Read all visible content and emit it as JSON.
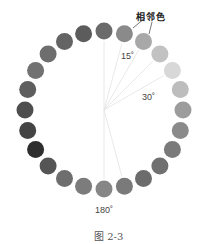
{
  "diagram": {
    "type": "color-wheel-grayscale",
    "center": [
      104,
      110
    ],
    "ring_radius": 79,
    "dot_radius": 8.5,
    "dots": [
      {
        "color": "#6a6a6a"
      },
      {
        "color": "#8a8a8a"
      },
      {
        "color": "#a8a8a8"
      },
      {
        "color": "#c2c2c2"
      },
      {
        "color": "#d8d8d8"
      },
      {
        "color": "#bdbdbd"
      },
      {
        "color": "#9c9c9c"
      },
      {
        "color": "#8a8a8a"
      },
      {
        "color": "#7a7a7a"
      },
      {
        "color": "#707070"
      },
      {
        "color": "#6c6c6c"
      },
      {
        "color": "#7a7a7a"
      },
      {
        "color": "#868686"
      },
      {
        "color": "#7c7c7c"
      },
      {
        "color": "#6e6e6e"
      },
      {
        "color": "#555555"
      },
      {
        "color": "#2e2e2e"
      },
      {
        "color": "#444444"
      },
      {
        "color": "#4e4e4e"
      },
      {
        "color": "#5e5e5e"
      },
      {
        "color": "#727272"
      },
      {
        "color": "#6e6e6e"
      },
      {
        "color": "#646464"
      },
      {
        "color": "#5c5c5c"
      }
    ],
    "radial_lines_deg": [
      0,
      15,
      30,
      45,
      60,
      180,
      165
    ],
    "line_color": "#e2e2e2",
    "leader_color": "#555555"
  },
  "labels": {
    "adjacent": "相邻色",
    "angle_15": "15˚",
    "angle_30": "30˚",
    "angle_180": "180˚"
  },
  "caption": "图 2-3"
}
